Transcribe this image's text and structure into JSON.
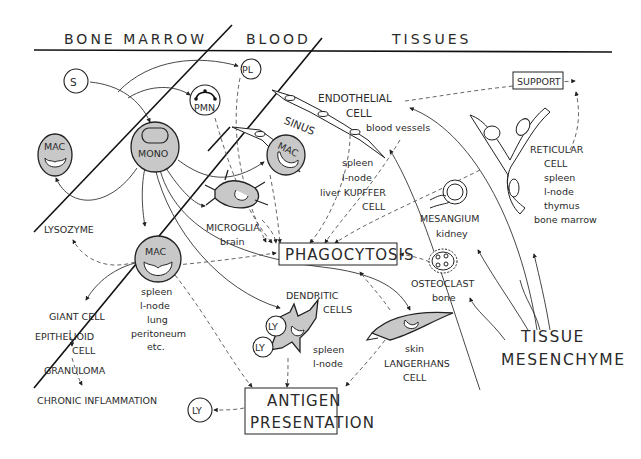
{
  "zones": {
    "bone_marrow": "BONE MARROW",
    "blood": "BLOOD",
    "tissues": "TISSUES"
  },
  "cells": {
    "stem": "S",
    "platelet": "PL",
    "pmn": "PMN",
    "mac_marrow": "MAC",
    "mono": "MONO",
    "mac_sinus": "MAC",
    "mac_tissue": "MAC",
    "ly_1": "LY",
    "ly_2": "LY",
    "ly_out": "LY"
  },
  "labels": {
    "sinus": "SINUS",
    "endothelial_1": "ENDOTHELIAL",
    "endothelial_2": "CELL",
    "blood_vessels": "blood vessels",
    "kupffer_1": "spleen",
    "kupffer_2": "l-node",
    "kupffer_3": "liver  KUPFFER",
    "kupffer_4": "CELL",
    "support": "SUPPORT",
    "reticular_1": "RETICULAR",
    "reticular_2": "CELL",
    "reticular_3": "spleen",
    "reticular_4": "l-node",
    "reticular_5": "thymus",
    "reticular_6": "bone marrow",
    "mesangium_1": "MESANGIUM",
    "mesangium_2": "kidney",
    "microglia_1": "MICROGLIA",
    "microglia_2": "brain",
    "phagocytosis": "PHAGOCYTOSIS",
    "lysozyme": "LYSOZYME",
    "mac_loc_1": "spleen",
    "mac_loc_2": "l-node",
    "mac_loc_3": "lung",
    "mac_loc_4": "peritoneum",
    "mac_loc_5": "etc.",
    "osteoclast_1": "OSTEOCLAST",
    "osteoclast_2": "bone",
    "dendritic_1": "DENDRITIC",
    "dendritic_2": "CELLS",
    "dendritic_loc_1": "spleen",
    "dendritic_loc_2": "l-node",
    "langerhans_1": "skin",
    "langerhans_2": "LANGERHANS",
    "langerhans_3": "CELL",
    "giant_cell": "GIANT CELL",
    "epithelioid_1": "EPITHELIOID",
    "epithelioid_2": "CELL",
    "granuloma": "GRANULOMA",
    "chronic": "CHRONIC  INFLAMMATION",
    "antigen_1": "ANTIGEN",
    "antigen_2": "PRESENTATION",
    "tissue_1": "TISSUE",
    "tissue_2": "MESENCHYME"
  },
  "colors": {
    "cell_fill": "#c8c8c8",
    "ink": "#222222"
  }
}
